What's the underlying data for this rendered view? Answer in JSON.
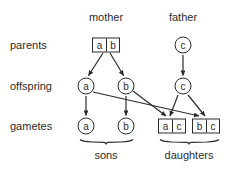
{
  "diagram": {
    "stroke_color": "#2b2b2b",
    "background_color": "#ffffff",
    "column_headers": [
      {
        "id": "mother",
        "label": "mother",
        "x": 106,
        "y": 17
      },
      {
        "id": "father",
        "label": "father",
        "x": 183,
        "y": 17
      }
    ],
    "row_labels": [
      {
        "id": "parents",
        "label": "parents",
        "x": 10,
        "y": 45
      },
      {
        "id": "offspring",
        "label": "offspring",
        "x": 10,
        "y": 86
      },
      {
        "id": "gametes",
        "label": "gametes",
        "x": 10,
        "y": 126
      }
    ],
    "group_labels": [
      {
        "id": "sons",
        "label": "sons",
        "x": 106,
        "y": 155
      },
      {
        "id": "daughters",
        "label": "daughters",
        "x": 189,
        "y": 155
      }
    ],
    "nodes": [
      {
        "id": "parent-mother-ab",
        "kind": "pair",
        "alleles": [
          "a",
          "b"
        ],
        "x": 106,
        "y": 45,
        "row": "parents",
        "parent": "mother"
      },
      {
        "id": "parent-father-c",
        "kind": "circle",
        "alleles": [
          "c"
        ],
        "x": 183,
        "y": 45,
        "row": "parents",
        "parent": "father"
      },
      {
        "id": "offspring-a",
        "kind": "circle",
        "alleles": [
          "a"
        ],
        "x": 86,
        "y": 86,
        "row": "offspring"
      },
      {
        "id": "offspring-b",
        "kind": "circle",
        "alleles": [
          "b"
        ],
        "x": 126,
        "y": 86,
        "row": "offspring"
      },
      {
        "id": "offspring-c",
        "kind": "circle",
        "alleles": [
          "c"
        ],
        "x": 183,
        "y": 86,
        "row": "offspring"
      },
      {
        "id": "gamete-a",
        "kind": "circle",
        "alleles": [
          "a"
        ],
        "x": 86,
        "y": 126,
        "row": "gametes",
        "group": "sons"
      },
      {
        "id": "gamete-b",
        "kind": "circle",
        "alleles": [
          "b"
        ],
        "x": 126,
        "y": 126,
        "row": "gametes",
        "group": "sons"
      },
      {
        "id": "gamete-ac",
        "kind": "pair",
        "alleles": [
          "a",
          "c"
        ],
        "x": 172,
        "y": 126,
        "row": "gametes",
        "group": "daughters"
      },
      {
        "id": "gamete-bc",
        "kind": "pair",
        "alleles": [
          "b",
          "c"
        ],
        "x": 206,
        "y": 126,
        "row": "gametes",
        "group": "daughters"
      }
    ],
    "edges": [
      {
        "id": "edge-mother-to-offspring-a",
        "from": "parent-mother-ab",
        "to": "offspring-a",
        "arrow": true
      },
      {
        "id": "edge-mother-to-offspring-b",
        "from": "parent-mother-ab",
        "to": "offspring-b",
        "arrow": true
      },
      {
        "id": "edge-father-to-offspring-c",
        "from": "parent-father-c",
        "to": "offspring-c",
        "arrow": true
      },
      {
        "id": "edge-offspring-a-to-gamete-a",
        "from": "offspring-a",
        "to": "gamete-a",
        "arrow": true
      },
      {
        "id": "edge-offspring-b-to-gamete-b",
        "from": "offspring-b",
        "to": "gamete-b",
        "arrow": true
      },
      {
        "id": "edge-offspring-a-to-gamete-bc",
        "from": "offspring-a",
        "to": "gamete-bc",
        "arrow": true
      },
      {
        "id": "edge-offspring-b-to-gamete-ac",
        "from": "offspring-b",
        "to": "gamete-ac",
        "arrow": true
      },
      {
        "id": "edge-offspring-c-to-gamete-ac",
        "from": "offspring-c",
        "to": "gamete-ac",
        "arrow": true
      },
      {
        "id": "edge-offspring-c-to-gamete-bc",
        "from": "offspring-c",
        "to": "gamete-bc",
        "arrow": true
      }
    ],
    "braces": [
      {
        "id": "brace-sons",
        "label": "sons",
        "x1": 80,
        "x2": 133,
        "y": 140
      },
      {
        "id": "brace-daughters",
        "label": "daughters",
        "x1": 160,
        "x2": 219,
        "y": 140
      }
    ]
  }
}
